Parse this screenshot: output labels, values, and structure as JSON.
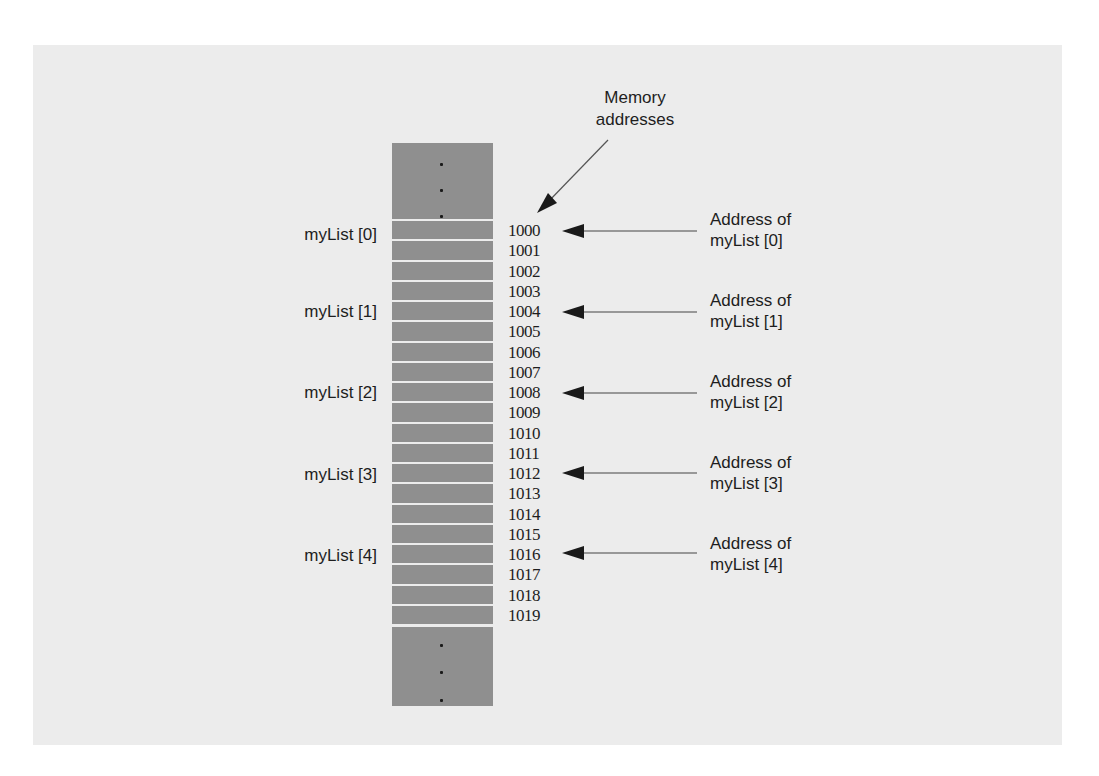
{
  "diagram": {
    "title": "Memory addresses",
    "title_lines": [
      "Memory",
      "addresses"
    ],
    "colors": {
      "background": "#ececec",
      "memory_cell": "#8f8f8f",
      "cell_separator": "#f2f2f2",
      "text": "#1e1e1e",
      "arrow": "#1a1a1a"
    },
    "addresses": [
      "1000",
      "1001",
      "1002",
      "1003",
      "1004",
      "1005",
      "1006",
      "1007",
      "1008",
      "1009",
      "1010",
      "1011",
      "1012",
      "1013",
      "1014",
      "1015",
      "1016",
      "1017",
      "1018",
      "1019"
    ],
    "elements": [
      {
        "label": "myList [0]",
        "address": "1000",
        "callout_line1": "Address of",
        "callout_line2": "myList [0]"
      },
      {
        "label": "myList [1]",
        "address": "1004",
        "callout_line1": "Address of",
        "callout_line2": "myList [1]"
      },
      {
        "label": "myList [2]",
        "address": "1008",
        "callout_line1": "Address of",
        "callout_line2": "myList [2]"
      },
      {
        "label": "myList [3]",
        "address": "1012",
        "callout_line1": "Address of",
        "callout_line2": "myList [3]"
      },
      {
        "label": "myList [4]",
        "address": "1016",
        "callout_line1": "Address of",
        "callout_line2": "myList [4]"
      }
    ],
    "ellipsis_dots": "⋮"
  }
}
